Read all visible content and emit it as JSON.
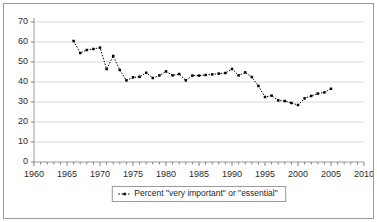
{
  "chart_data": {
    "type": "line",
    "title": "",
    "subtitle": "",
    "xlabel": "",
    "ylabel": "",
    "xlim": [
      1960,
      2010
    ],
    "ylim": [
      0,
      70
    ],
    "ytick_step": 10,
    "xtick_step": 5,
    "xminor_step": 1,
    "grid": "horizontal",
    "legend_position": "bottom",
    "marker": "small-filled-square",
    "line_style": "dotted",
    "series_color": "#000000",
    "grid_color": "#d9d9d9",
    "axis_color": "#808080",
    "yticks": [
      "0",
      "10",
      "20",
      "30",
      "40",
      "50",
      "60",
      "70"
    ],
    "xticks": [
      "1960",
      "1965",
      "1970",
      "1975",
      "1980",
      "1985",
      "1990",
      "1995",
      "2000",
      "2005",
      "2010"
    ],
    "series": [
      {
        "name": "Percent \"very important\" or \"essential\"",
        "x": [
          1966,
          1967,
          1968,
          1969,
          1970,
          1971,
          1972,
          1973,
          1974,
          1975,
          1976,
          1977,
          1978,
          1979,
          1980,
          1981,
          1982,
          1983,
          1984,
          1985,
          1986,
          1987,
          1988,
          1989,
          1990,
          1991,
          1992,
          1993,
          1994,
          1995,
          1996,
          1997,
          1998,
          1999,
          2000,
          2001,
          2002,
          2003,
          2004,
          2005
        ],
        "values": [
          60.5,
          54.5,
          56.0,
          56.5,
          57.2,
          46.5,
          53.0,
          46.0,
          40.8,
          42.3,
          42.6,
          44.6,
          42.0,
          43.3,
          45.3,
          43.3,
          44.0,
          40.8,
          43.2,
          43.2,
          43.5,
          43.8,
          44.2,
          44.5,
          46.5,
          43.3,
          44.8,
          42.5,
          38.0,
          32.5,
          33.2,
          30.8,
          30.5,
          29.5,
          28.5,
          31.8,
          33.0,
          34.2,
          34.8,
          36.6
        ]
      }
    ],
    "legend": [
      {
        "label": "Percent \"very important\" or \"essential\"",
        "marker": "dotted-line-with-square"
      }
    ]
  }
}
